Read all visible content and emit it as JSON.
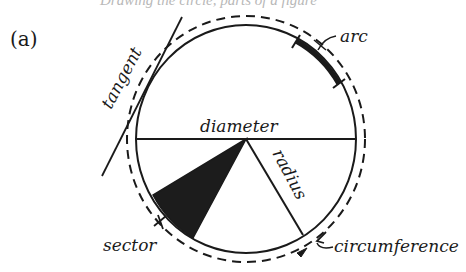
{
  "figure": {
    "top_cutoff_text": "Drawing the circle, parts of a figure",
    "panel_label": "(a)",
    "colors": {
      "ink": "#1a1a1a",
      "sector_fill": "#1c1c1c",
      "background": "#ffffff"
    },
    "labels": {
      "tangent": "tangent",
      "arc": "arc",
      "diameter": "diameter",
      "radius": "radius",
      "sector": "sector",
      "circumference": "circumference"
    },
    "circle": {
      "center": [
        246,
        139
      ],
      "radius_x": 110,
      "radius_y": 114,
      "dashed_radius_x": 119,
      "dashed_radius_y": 123
    }
  }
}
